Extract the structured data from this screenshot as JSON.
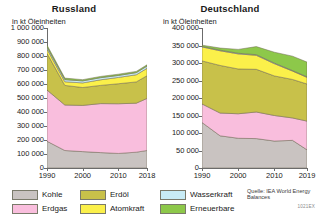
{
  "charts": [
    {
      "id": "russland",
      "title": "Russland",
      "axis_unit": "in kt Öleinheiten",
      "y_ticks": [
        "0",
        "100 000",
        "200 000",
        "300 000",
        "400 000",
        "500 000",
        "600 000",
        "700 000",
        "800 000",
        "900 000",
        "1 000 000"
      ],
      "x_ticks": [
        "1990",
        "2000",
        "2010",
        "2018"
      ]
    },
    {
      "id": "deutschland",
      "title": "Deutschland",
      "axis_unit": "in kt Öleinheiten",
      "y_ticks": [
        "0",
        "50 000",
        "100 000",
        "150 000",
        "200 000",
        "250 000",
        "300 000",
        "350 000",
        "400 000"
      ],
      "x_ticks": [
        "1990",
        "2000",
        "2010",
        "2019"
      ]
    }
  ],
  "legend": [
    {
      "label": "Kohle",
      "color": "#c9c3c1"
    },
    {
      "label": "Erdgas",
      "color": "#f9bedd"
    },
    {
      "label": "Erdöl",
      "color": "#c8c14a"
    },
    {
      "label": "Atomkraft",
      "color": "#fbf04a"
    },
    {
      "label": "Wasserkraft",
      "color": "#c8ecf5"
    },
    {
      "label": "Erneuerbare",
      "color": "#8dc84a"
    }
  ],
  "source": {
    "text": "Quelle: IEA World Energy Balances",
    "code": "1021EX"
  },
  "chart_data": [
    {
      "type": "area",
      "stacked": true,
      "title": "Russland",
      "xlabel": "",
      "ylabel": "in kt Öleinheiten",
      "ylim": [
        0,
        1000000
      ],
      "xlim": [
        1990,
        2018
      ],
      "grid": false,
      "legend_position": "bottom",
      "x": [
        1990,
        1995,
        2000,
        2005,
        2010,
        2015,
        2018
      ],
      "xtick_labels": [
        "1990",
        "2000",
        "2010",
        "2018"
      ],
      "ytick_labels": [
        "0",
        "100 000",
        "200 000",
        "300 000",
        "400 000",
        "500 000",
        "600 000",
        "700 000",
        "800 000",
        "900 000",
        "1 000 000"
      ],
      "series": [
        {
          "name": "Kohle",
          "color": "#c9c3c1",
          "values": [
            191000,
            125000,
            117000,
            110000,
            104000,
            113000,
            125000
          ]
        },
        {
          "name": "Erdgas",
          "color": "#f9bedd",
          "values": [
            366000,
            325000,
            330000,
            350000,
            355000,
            350000,
            372000
          ]
        },
        {
          "name": "Erdöl",
          "color": "#c8c14a",
          "values": [
            262000,
            140000,
            128000,
            130000,
            143000,
            152000,
            162000
          ]
        },
        {
          "name": "Atomkraft",
          "color": "#fbf04a",
          "values": [
            31000,
            26000,
            33000,
            40000,
            45000,
            51000,
            53000
          ]
        },
        {
          "name": "Wasserkraft",
          "color": "#c8ecf5",
          "values": [
            14000,
            15000,
            14000,
            15000,
            14000,
            15000,
            16000
          ]
        },
        {
          "name": "Erneuerbare",
          "color": "#8dc84a",
          "values": [
            14000,
            11000,
            9000,
            9000,
            9000,
            9000,
            9000
          ]
        }
      ],
      "totals": [
        878000,
        642000,
        631000,
        654000,
        670000,
        690000,
        737000
      ]
    },
    {
      "type": "area",
      "stacked": true,
      "title": "Deutschland",
      "xlabel": "",
      "ylabel": "in kt Öleinheiten",
      "ylim": [
        0,
        400000
      ],
      "xlim": [
        1990,
        2019
      ],
      "grid": false,
      "legend_position": "bottom",
      "x": [
        1990,
        1995,
        2000,
        2005,
        2010,
        2015,
        2019
      ],
      "xtick_labels": [
        "1990",
        "2000",
        "2010",
        "2019"
      ],
      "ytick_labels": [
        "0",
        "50 000",
        "100 000",
        "150 000",
        "200 000",
        "250 000",
        "300 000",
        "350 000",
        "400 000"
      ],
      "series": [
        {
          "name": "Kohle",
          "color": "#c9c3c1",
          "values": [
            130000,
            92000,
            85000,
            84000,
            77000,
            79000,
            52000
          ]
        },
        {
          "name": "Erdgas",
          "color": "#f9bedd",
          "values": [
            53000,
            65000,
            70000,
            76000,
            73000,
            64000,
            82000
          ]
        },
        {
          "name": "Erdöl",
          "color": "#c8c14a",
          "values": [
            123000,
            136000,
            128000,
            122000,
            113000,
            110000,
            106000
          ]
        },
        {
          "name": "Atomkraft",
          "color": "#fbf04a",
          "values": [
            40000,
            42000,
            43000,
            40000,
            35000,
            24000,
            19000
          ]
        },
        {
          "name": "Wasserkraft",
          "color": "#c8ecf5",
          "values": [
            1500,
            1700,
            1900,
            1800,
            1800,
            1500,
            1600
          ]
        },
        {
          "name": "Erneuerbare",
          "color": "#8dc84a",
          "values": [
            3500,
            6000,
            11000,
            23000,
            31000,
            41000,
            42000
          ]
        }
      ],
      "totals": [
        351000,
        342700,
        338900,
        346800,
        330800,
        319500,
        302600
      ]
    }
  ]
}
